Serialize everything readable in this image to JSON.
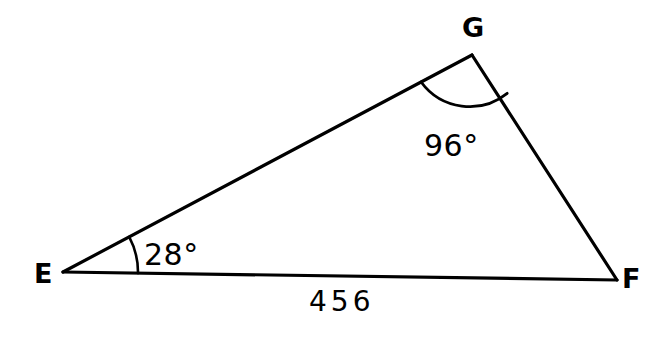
{
  "figure": {
    "kind": "triangle-geometry-diagram",
    "background_color": "#ffffff",
    "stroke_color": "#000000",
    "stroke_width": 3,
    "vertices": {
      "e": {
        "label": "E",
        "x": 63,
        "y": 272
      },
      "f": {
        "label": "F",
        "x": 617,
        "y": 280
      },
      "g": {
        "label": "G",
        "x": 472,
        "y": 55
      }
    },
    "angles": {
      "e": {
        "label": "28°",
        "value": 28,
        "unit": "degrees",
        "at_vertex": "E",
        "arc_radius": 75
      },
      "g": {
        "label": "96°",
        "value": 96,
        "unit": "degrees",
        "at_vertex": "G",
        "arc_radius": 60
      }
    },
    "sides": {
      "ef": {
        "label": "456",
        "value": 456,
        "from": "E",
        "to": "F"
      }
    }
  }
}
